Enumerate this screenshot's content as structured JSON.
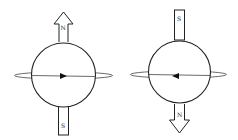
{
  "diagram": {
    "stroke_color": "#222222",
    "left": {
      "top_pole_label": "N",
      "bottom_pole_label": "S",
      "arrow_direction": "up",
      "rotation_arrow": "right"
    },
    "right": {
      "top_pole_label": "S",
      "bottom_pole_label": "N",
      "arrow_direction": "down",
      "rotation_arrow": "left"
    }
  }
}
